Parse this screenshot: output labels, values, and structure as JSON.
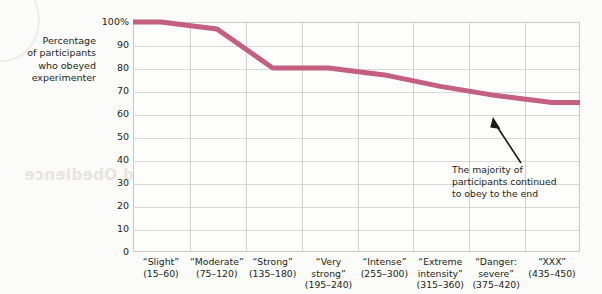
{
  "axis_title": {
    "lines": [
      "Percentage",
      "of participants",
      "who obeyed",
      "experimenter"
    ]
  },
  "annotation": {
    "lines": [
      "The majority of",
      "participants continued",
      "to obey to the end"
    ]
  },
  "bleed_text": {
    "line1": "rs Ensuring Conformity and Obedience",
    "line2": "Nature",
    "line3": "to the "
  },
  "colors": {
    "series": "#c4607f",
    "grid": "#d8d8d8",
    "frame": "#c9c9c9",
    "text": "#231f20",
    "plot_bg": "#fdfdfc"
  },
  "chart_data": {
    "type": "line",
    "title": "",
    "xlabel": "",
    "ylabel": "Percentage of participants who obeyed experimenter",
    "ylim": [
      0,
      100
    ],
    "yticks": [
      100,
      90,
      80,
      70,
      60,
      50,
      40,
      30,
      20,
      10,
      0
    ],
    "ytick_labels": [
      "100%",
      "90",
      "80",
      "70",
      "60",
      "50",
      "40",
      "30",
      "20",
      "10",
      "0"
    ],
    "grid": true,
    "legend": null,
    "categories": [
      {
        "name": "“Slight”",
        "range": "(15–60)"
      },
      {
        "name": "“Moderate”",
        "range": "(75–120)"
      },
      {
        "name": "“Strong”",
        "range": "(135–180)"
      },
      {
        "name": "“Very",
        "name2": "strong”",
        "range": "(195–240)"
      },
      {
        "name": "“Intense”",
        "range": "(255–300)"
      },
      {
        "name": "“Extreme",
        "name2": "intensity”",
        "range": "(315–360)"
      },
      {
        "name": "“Danger:",
        "name2": "severe”",
        "range": "(375–420)"
      },
      {
        "name": "“XXX”",
        "range": "(435–450)"
      }
    ],
    "category_labels": [
      "“Slight” (15–60)",
      "“Moderate” (75–120)",
      "“Strong” (135–180)",
      "“Very strong” (195–240)",
      "“Intense” (255–300)",
      "“Extreme intensity” (315–360)",
      "“Danger: severe” (375–420)",
      "“XXX” (435–450)"
    ],
    "values": [
      100,
      97,
      80,
      80,
      77,
      72,
      68,
      65
    ],
    "annotation": "The majority of participants continued to obey to the end"
  }
}
